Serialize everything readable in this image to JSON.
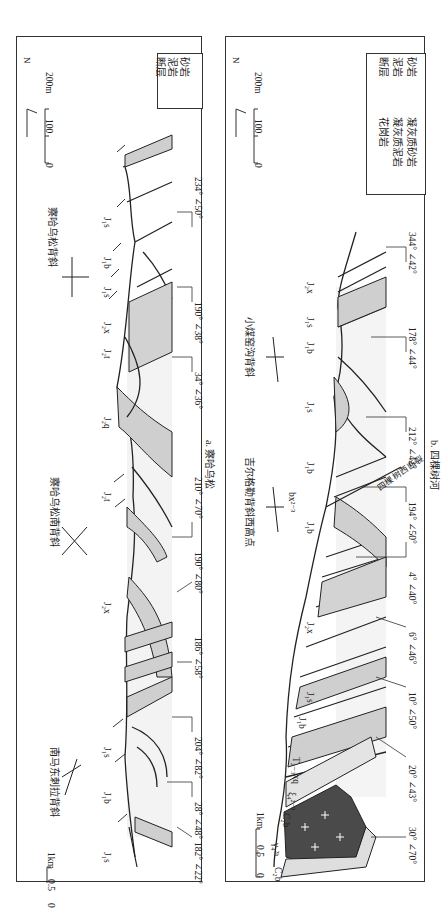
{
  "panel_a": {
    "caption": "a. 察哈乌松",
    "legend": [
      {
        "symbol": "dots",
        "label": "砂岩"
      },
      {
        "symbol": "dashes-gray",
        "label": "泥岩"
      },
      {
        "symbol": "fault",
        "label": "断层"
      }
    ],
    "north": "N",
    "vertical_scale": {
      "top": "200m",
      "mid": "100",
      "bottom": "0"
    },
    "horizontal_scale": {
      "start": "0",
      "mid": "0.5",
      "end": "1km"
    },
    "fold_names": [
      "察哈乌松背斜",
      "察哈乌松南背斜",
      "南马东刺拉背斜"
    ],
    "strata_labels": [
      "J₁s",
      "J₁b",
      "J₁s",
      "J₂x",
      "J₂t",
      "J₂q",
      "J₂t",
      "J₂x",
      "J₁s",
      "J₁b",
      "J₁s"
    ],
    "attitudes": [
      "234° ∠50°",
      "190° ∠38°",
      "34° ∠36°",
      "210° ∠70°",
      "190° ∠80°",
      "186° ∠58°",
      "204° ∠82°",
      "28° ∠48°",
      "182° ∠22°"
    ]
  },
  "panel_b": {
    "caption": "b. 四棵树河",
    "legend": [
      {
        "symbol": "tuff-sand",
        "label": "凝灰质砂岩"
      },
      {
        "symbol": "tuff-mud",
        "label": "凝灰质泥岩"
      },
      {
        "symbol": "granite",
        "label": "花岗岩"
      },
      {
        "symbol": "dots",
        "label": "砂岩"
      },
      {
        "symbol": "dashes-gray",
        "label": "泥岩"
      },
      {
        "symbol": "fault",
        "label": "断层"
      }
    ],
    "north": "N",
    "vertical_scale": {
      "top": "200m",
      "mid": "100",
      "bottom": "0"
    },
    "horizontal_scale": {
      "start": "0",
      "mid": "0.5",
      "end": "1km"
    },
    "fold_names": [
      "小煤窑沟背斜",
      "吉尔格勒背斜西高点"
    ],
    "fault_name": "四棵树西断裂",
    "strata_labels": [
      "J₂x",
      "J₁s",
      "J₁b",
      "J₁s",
      "J₁b",
      "bx²⁻³",
      "J₁b",
      "J₂x",
      "J₁s",
      "J₁b",
      "T₂₋₃xq",
      "ξ₄²⁻³",
      "C₂b",
      "γ₄²ᵇ",
      "C₂b"
    ],
    "attitudes": [
      "344° ∠42°",
      "178° ∠44°",
      "212° ∠42°",
      "194° ∠50°",
      "4° ∠40°",
      "6° ∠46°",
      "10° ∠50°",
      "20° ∠43°",
      "30° ∠70°"
    ]
  },
  "colors": {
    "mudstone": "#cfcfcf",
    "granite": "#4a4a4a",
    "tuff": "#e4e4e4",
    "sandstone": "#f2f2f2",
    "line": "#222222"
  }
}
